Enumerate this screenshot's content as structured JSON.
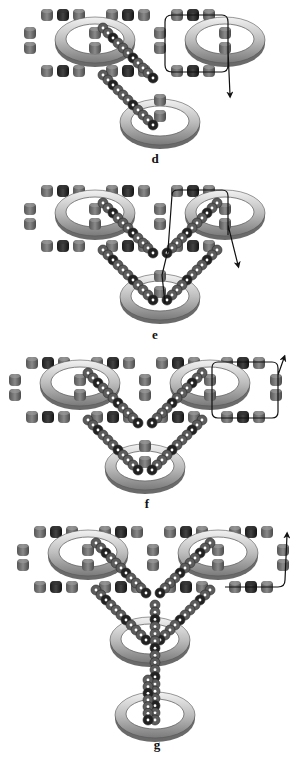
{
  "figure": {
    "colors": {
      "background": "#ffffff",
      "bead_gray": "#6e6e6e",
      "bead_dark": "#2a2a2a",
      "ring_light": "#e8e8e8",
      "ring_dark": "#8a8a8a",
      "path_line": "#111111"
    },
    "panels": [
      {
        "id": "d",
        "label": "d",
        "label_pos": [
          155,
          163
        ],
        "rings": [
          [
            95,
            40
          ],
          [
            225,
            40
          ],
          [
            160,
            122
          ]
        ],
        "bead_rows": [
          {
            "y": 15,
            "xs": [
              47,
              63,
              79
            ],
            "dark_index": 1
          },
          {
            "y": 15,
            "xs": [
              112,
              128,
              144
            ],
            "dark_index": 1
          },
          {
            "y": 15,
            "xs": [
              177,
              193,
              209
            ],
            "dark_index": 1
          },
          {
            "y": 71,
            "xs": [
              47,
              63,
              79
            ],
            "dark_index": 1
          },
          {
            "y": 71,
            "xs": [
              112,
              128,
              144
            ],
            "dark_index": 1
          },
          {
            "y": 71,
            "xs": [
              177,
              193,
              209
            ],
            "dark_index": 1
          }
        ],
        "bead_columns": [
          {
            "x": 30,
            "ys": [
              33,
              48
            ]
          },
          {
            "x": 95,
            "ys": [
              33,
              48
            ]
          },
          {
            "x": 160,
            "ys": [
              33,
              48
            ]
          },
          {
            "x": 225,
            "ys": [
              33,
              48
            ]
          },
          {
            "x": 160,
            "ys": [
              100,
              116
            ]
          }
        ],
        "chains": [
          {
            "from": [
              103,
              28
            ],
            "to": [
              153,
              78
            ]
          },
          {
            "from": [
              103,
              75
            ],
            "to": [
              153,
              125
            ]
          }
        ],
        "path": "M172,15 L222,15 Q228,15 228,22 L228,65 Q228,72 222,72 L172,72 Q165,72 165,65 L165,22 Q165,15 172,15 M228,50 L230,95",
        "arrow": {
          "x": 236,
          "y": 98,
          "dir": "down"
        }
      },
      {
        "id": "e",
        "label": "e",
        "label_pos": [
          155,
          339
        ],
        "rings": [
          [
            95,
            213
          ],
          [
            225,
            213
          ],
          [
            160,
            297
          ]
        ],
        "bead_rows": [
          {
            "y": 191,
            "xs": [
              47,
              63,
              79
            ],
            "dark_index": 1
          },
          {
            "y": 191,
            "xs": [
              112,
              128,
              144
            ],
            "dark_index": 1
          },
          {
            "y": 191,
            "xs": [
              177,
              193,
              209
            ],
            "dark_index": 1
          },
          {
            "y": 246,
            "xs": [
              47,
              63,
              79
            ],
            "dark_index": 1
          },
          {
            "y": 246,
            "xs": [
              112,
              128,
              144
            ],
            "dark_index": 1
          },
          {
            "y": 246,
            "xs": [
              177,
              193,
              209
            ],
            "dark_index": 1
          }
        ],
        "bead_columns": [
          {
            "x": 30,
            "ys": [
              209,
              224
            ]
          },
          {
            "x": 95,
            "ys": [
              209,
              224
            ]
          },
          {
            "x": 160,
            "ys": [
              209,
              224
            ]
          },
          {
            "x": 225,
            "ys": [
              209,
              224
            ]
          },
          {
            "x": 160,
            "ys": [
              276,
              292
            ]
          }
        ],
        "chains": [
          {
            "from": [
              103,
              203
            ],
            "to": [
              153,
              253
            ]
          },
          {
            "from": [
              103,
              250
            ],
            "to": [
              153,
              300
            ]
          },
          {
            "from": [
              217,
              203
            ],
            "to": [
              167,
              253
            ]
          },
          {
            "from": [
              217,
              250
            ],
            "to": [
              167,
              300
            ]
          }
        ],
        "path": "M165,303 L162,275 L168,250 L172,195 Q172,190 178,190 L222,190 Q228,190 228,196 L228,235 M228,225 L238,265",
        "arrow": {
          "x": 242,
          "y": 268,
          "dir": "down"
        }
      },
      {
        "id": "f",
        "label": "f",
        "label_pos": [
          147,
          508
        ],
        "rings": [
          [
            80,
            383
          ],
          [
            210,
            383
          ],
          [
            145,
            467
          ]
        ],
        "bead_rows": [
          {
            "y": 363,
            "xs": [
              32,
              48,
              64
            ],
            "dark_index": 1
          },
          {
            "y": 363,
            "xs": [
              97,
              113,
              129
            ],
            "dark_index": 1
          },
          {
            "y": 363,
            "xs": [
              162,
              178,
              194
            ],
            "dark_index": 1
          },
          {
            "y": 363,
            "xs": [
              227,
              243,
              259
            ],
            "dark_index": 1
          },
          {
            "y": 417,
            "xs": [
              32,
              48,
              64
            ],
            "dark_index": 1
          },
          {
            "y": 417,
            "xs": [
              97,
              113,
              129
            ],
            "dark_index": 1
          },
          {
            "y": 417,
            "xs": [
              162,
              178,
              194
            ],
            "dark_index": 1
          },
          {
            "y": 417,
            "xs": [
              227,
              243,
              259
            ],
            "dark_index": 1
          }
        ],
        "bead_columns": [
          {
            "x": 15,
            "ys": [
              380,
              395
            ]
          },
          {
            "x": 80,
            "ys": [
              380,
              395
            ]
          },
          {
            "x": 145,
            "ys": [
              380,
              395
            ]
          },
          {
            "x": 210,
            "ys": [
              380,
              395
            ]
          },
          {
            "x": 276,
            "ys": [
              380,
              395
            ]
          },
          {
            "x": 145,
            "ys": [
              446,
              462
            ]
          }
        ],
        "chains": [
          {
            "from": [
              88,
              373
            ],
            "to": [
              138,
              423
            ]
          },
          {
            "from": [
              88,
              420
            ],
            "to": [
              138,
              470
            ]
          },
          {
            "from": [
              202,
              373
            ],
            "to": [
              152,
              423
            ]
          },
          {
            "from": [
              202,
              420
            ],
            "to": [
              152,
              470
            ]
          }
        ],
        "path": "M218,362 Q212,362 212,368 L212,412 Q212,418 218,418 L272,418 Q278,418 278,412 L278,368 Q278,362 272,362 L218,362 M278,375 L284,358",
        "arrow": {
          "x": 287,
          "y": 354,
          "dir": "up"
        }
      },
      {
        "id": "g",
        "label": "g",
        "label_pos": [
          157,
          749
        ],
        "rings": [
          [
            88,
            553
          ],
          [
            218,
            553
          ],
          [
            150,
            640
          ],
          [
            155,
            715
          ]
        ],
        "bead_rows": [
          {
            "y": 532,
            "xs": [
              40,
              56,
              72
            ],
            "dark_index": 1
          },
          {
            "y": 532,
            "xs": [
              105,
              121,
              137
            ],
            "dark_index": 1
          },
          {
            "y": 532,
            "xs": [
              170,
              186,
              202
            ],
            "dark_index": 1
          },
          {
            "y": 532,
            "xs": [
              235,
              251,
              267
            ],
            "dark_index": 1
          },
          {
            "y": 587,
            "xs": [
              40,
              56,
              72
            ],
            "dark_index": 1
          },
          {
            "y": 587,
            "xs": [
              105,
              121,
              137
            ],
            "dark_index": 1
          },
          {
            "y": 587,
            "xs": [
              170,
              186,
              202
            ],
            "dark_index": 1
          },
          {
            "y": 587,
            "xs": [
              235,
              251,
              267
            ],
            "dark_index": 1
          }
        ],
        "bead_columns": [
          {
            "x": 23,
            "ys": [
              550,
              565
            ]
          },
          {
            "x": 88,
            "ys": [
              550,
              565
            ]
          },
          {
            "x": 153,
            "ys": [
              550,
              565
            ]
          },
          {
            "x": 218,
            "ys": [
              550,
              565
            ]
          },
          {
            "x": 283,
            "ys": [
              550,
              565
            ]
          }
        ],
        "chains": [
          {
            "from": [
              96,
              543
            ],
            "to": [
              146,
              593
            ]
          },
          {
            "from": [
              96,
              590
            ],
            "to": [
              146,
              640
            ]
          },
          {
            "from": [
              210,
              543
            ],
            "to": [
              160,
              593
            ]
          },
          {
            "from": [
              210,
              590
            ],
            "to": [
              160,
              640
            ]
          },
          {
            "from": [
              155,
              605
            ],
            "to": [
              155,
              720
            ]
          },
          {
            "from": [
              148,
              680
            ],
            "to": [
              148,
              720
            ]
          }
        ],
        "path": "M225,587 L278,587 Q285,587 285,580 L287,535",
        "arrow": {
          "x": 292,
          "y": 524,
          "dir": "up"
        }
      }
    ]
  }
}
